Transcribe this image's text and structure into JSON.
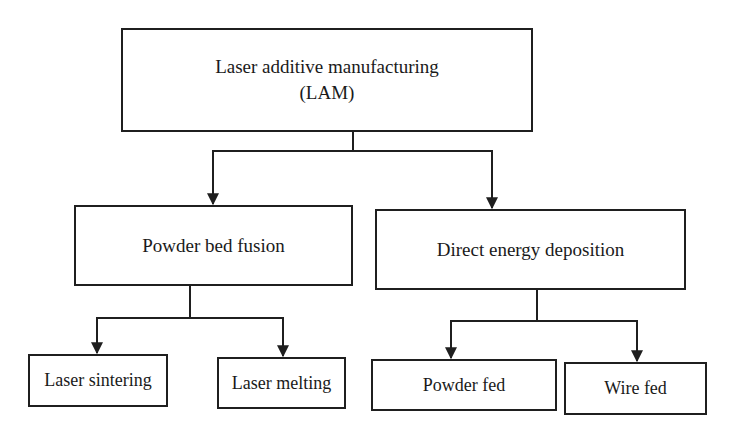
{
  "diagram": {
    "type": "hierarchy",
    "root": {
      "title": "Laser additive manufacturing",
      "subtitle": "(LAM)"
    },
    "branches": [
      {
        "label": "Powder bed fusion",
        "children": [
          "Laser sintering",
          "Laser melting"
        ]
      },
      {
        "label": "Direct energy deposition",
        "children": [
          "Powder fed",
          "Wire fed"
        ]
      }
    ],
    "colors": {
      "line": "#1f1f1f",
      "background": "#ffffff",
      "text": "#1a1a1a"
    }
  }
}
